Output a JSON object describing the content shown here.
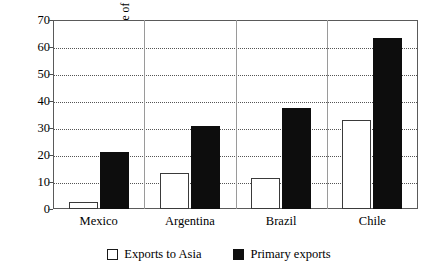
{
  "chart_data": {
    "type": "bar",
    "title": "",
    "subtitle": "",
    "xlabel": "",
    "ylabel": "Percentage of total exports",
    "categories": [
      "Mexico",
      "Argentina",
      "Brazil",
      "Chile"
    ],
    "series": [
      {
        "name": "Exports to Asia",
        "color": "#ffffff",
        "edge_color": "#3a3a3a",
        "values": [
          2.5,
          13.3,
          11.5,
          33.0
        ]
      },
      {
        "name": "Primary exports",
        "color": "#0d0d0d",
        "edge_color": "#0d0d0d",
        "values": [
          21.2,
          30.6,
          37.3,
          63.2
        ]
      }
    ],
    "ylim": [
      0,
      70
    ],
    "yticks": [
      0,
      10,
      20,
      30,
      40,
      50,
      60,
      70
    ],
    "ytick_labels": [
      "0",
      "10",
      "20",
      "30",
      "40",
      "50",
      "60",
      "70"
    ],
    "grid": true,
    "grid_style": "dotted",
    "grid_axis": "y",
    "legend_position": "bottom",
    "legend": [
      "Exports to Asia",
      "Primary exports"
    ]
  },
  "legend": {
    "items": [
      {
        "label": "Exports to Asia",
        "swatch": "legend-swatch-light"
      },
      {
        "label": "Primary exports",
        "swatch": "legend-swatch-dark"
      }
    ]
  },
  "colors": {
    "background": "#ffffff",
    "frame": "#5a5a5a",
    "grid": "#555555",
    "light_bar": "#ffffff",
    "dark_bar": "#0d0d0d",
    "text": "#000000"
  }
}
